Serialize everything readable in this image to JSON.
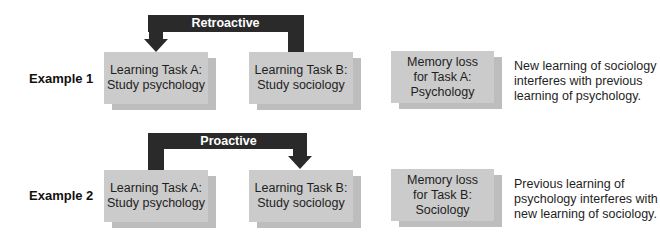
{
  "examples": [
    {
      "label": "Example 1",
      "arrow": {
        "label": "Retroactive Interference",
        "direction": "from Task B back to Task A",
        "color": "#2a2a2a"
      },
      "boxes": [
        {
          "text": "Learning Task A:\nStudy psychology"
        },
        {
          "text": "Learning Task B:\nStudy sociology"
        },
        {
          "text": "Memory loss\nfor Task A:\nPsychology"
        }
      ],
      "description": "New learning of sociology\ninterferes with previous\nlearning of psychology."
    },
    {
      "label": "Example 2",
      "arrow": {
        "label": "Proactive Interference",
        "direction": "from Task A forward to Task B",
        "color": "#2a2a2a"
      },
      "boxes": [
        {
          "text": "Learning Task A:\nStudy psychology"
        },
        {
          "text": "Learning Task B:\nStudy sociology"
        },
        {
          "text": "Memory loss\nfor Task B:\nSociology"
        }
      ],
      "description": "Previous learning of\npsychology interferes with\nnew learning of sociology."
    }
  ],
  "colors": {
    "box": "#cbcbcb",
    "box_shadow": "#bdbdbd",
    "arrow": "#2a2a2a"
  }
}
